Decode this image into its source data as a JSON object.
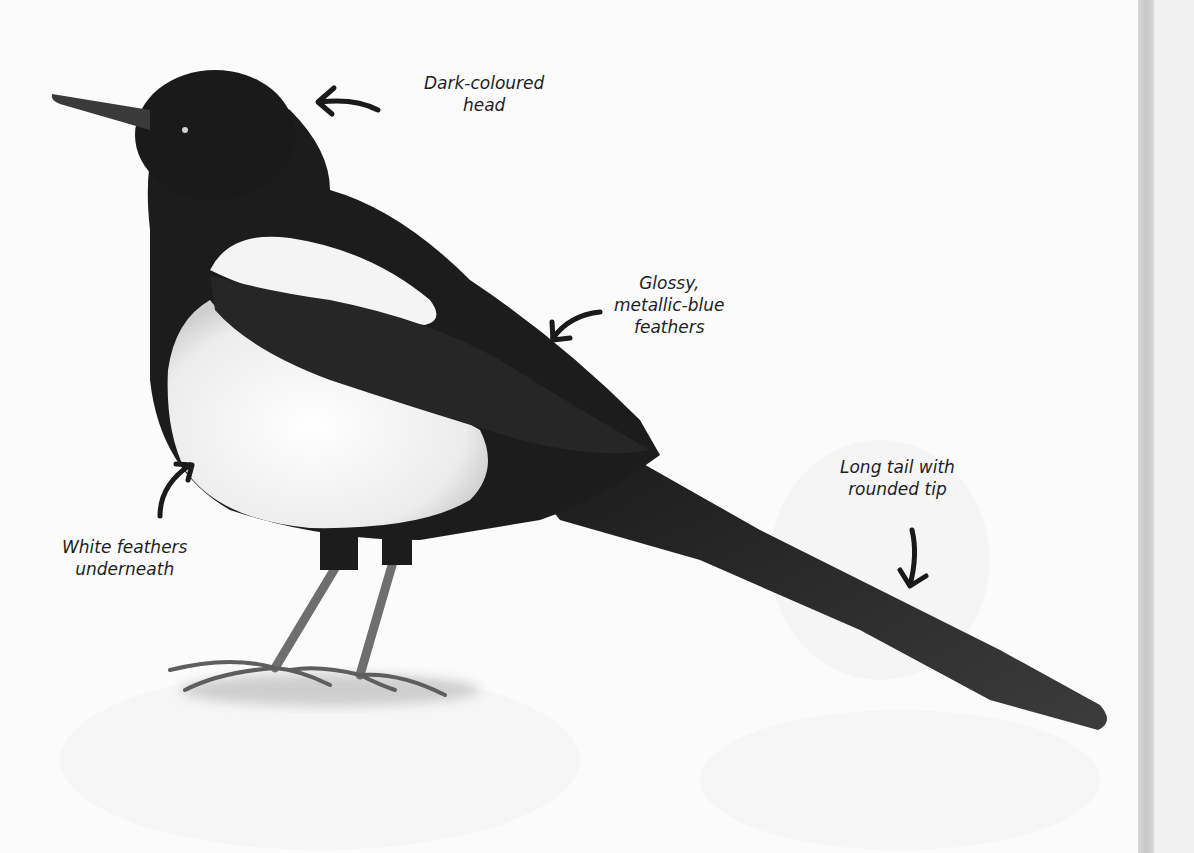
{
  "labels": [
    {
      "id": "head",
      "lines": [
        "Dark-coloured",
        "head"
      ]
    },
    {
      "id": "wing",
      "lines": [
        "Glossy,",
        "metallic-blue",
        "feathers"
      ]
    },
    {
      "id": "tail",
      "lines": [
        "Long tail with",
        "rounded tip"
      ]
    },
    {
      "id": "belly",
      "lines": [
        "White feathers",
        "underneath"
      ]
    }
  ],
  "colors": {
    "page": "#fbfbfb",
    "plumage_dark": "#1c1c1c",
    "plumage_white": "#f4f4f4",
    "legs": "#6e6e6e",
    "text": "#1e1e1e",
    "spine": "#cfcfcf"
  }
}
